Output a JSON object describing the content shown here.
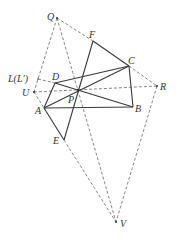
{
  "figure": {
    "type": "geometry-diagram",
    "labels": {
      "Q": "Q",
      "F": "F",
      "C": "C",
      "R": "R",
      "L": "L(L′)",
      "D": "D",
      "U": "U",
      "P": "P",
      "B": "B",
      "A": "A",
      "E": "E",
      "V": "V"
    },
    "points": {
      "Q": [
        57,
        18
      ],
      "F": [
        93,
        41
      ],
      "C": [
        129,
        66
      ],
      "R": [
        157,
        86
      ],
      "L": [
        38,
        79
      ],
      "D": [
        55,
        83
      ],
      "U": [
        34,
        92
      ],
      "P": [
        78,
        90
      ],
      "A": [
        44,
        108
      ],
      "B": [
        133,
        107
      ],
      "E": [
        64,
        140
      ],
      "V": [
        116,
        222
      ]
    },
    "solid_segments": [
      [
        "A",
        "B"
      ],
      [
        "B",
        "C"
      ],
      [
        "C",
        "D"
      ],
      [
        "D",
        "A"
      ],
      [
        "A",
        "C"
      ],
      [
        "D",
        "B"
      ],
      [
        "F",
        "C"
      ],
      [
        "F",
        "E"
      ],
      [
        "A",
        "E"
      ]
    ],
    "dashed_segments": [
      [
        "Q",
        "F"
      ],
      [
        "C",
        "R"
      ],
      [
        "Q",
        "U"
      ],
      [
        "U",
        "A"
      ],
      [
        "Q",
        "V"
      ],
      [
        "R",
        "V"
      ],
      [
        "E",
        "V"
      ],
      [
        "L",
        "D"
      ],
      [
        "U",
        "R"
      ]
    ],
    "colors": {
      "line": "#3a3a3a",
      "dashed": "#6a6a6a",
      "background": "#ffffff"
    }
  }
}
